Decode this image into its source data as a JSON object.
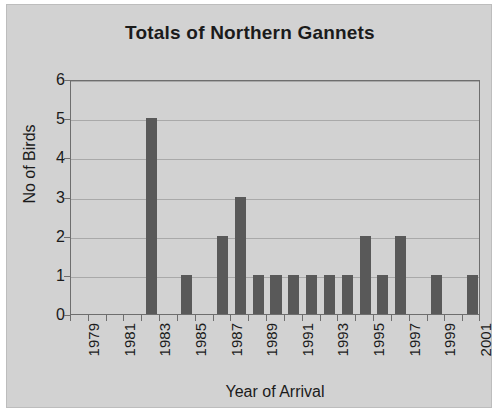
{
  "chart_data": {
    "type": "bar",
    "title": "Totals of Northern Gannets",
    "xlabel": "Year of Arrival",
    "ylabel": "No of Birds",
    "categories": [
      "1979",
      "1980",
      "1981",
      "1982",
      "1983",
      "1984",
      "1985",
      "1986",
      "1987",
      "1988",
      "1989",
      "1990",
      "1991",
      "1992",
      "1993",
      "1994",
      "1995",
      "1996",
      "1997",
      "1998",
      "1999",
      "2000",
      "2001"
    ],
    "values": [
      0,
      0,
      0,
      0,
      5,
      0,
      1,
      0,
      2,
      3,
      1,
      1,
      1,
      1,
      1,
      1,
      2,
      1,
      2,
      0,
      1,
      0,
      1
    ],
    "visible_tick_labels": [
      "1979",
      "1981",
      "1983",
      "1985",
      "1987",
      "1989",
      "1991",
      "1993",
      "1995",
      "1997",
      "1999",
      "2001"
    ],
    "ylim": [
      0,
      6
    ],
    "y_ticks": [
      0,
      1,
      2,
      3,
      4,
      5,
      6
    ],
    "grid": true,
    "legend": false,
    "bar_color": "#595959",
    "plot_background": "#d2d2d2",
    "axis_color": "#6e6e6e",
    "gridline_color": "#a9a9a9",
    "text_color": "#1b1b1b"
  }
}
